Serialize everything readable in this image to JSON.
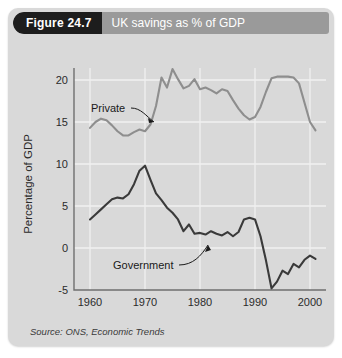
{
  "figure": {
    "tag": "Figure 24.7",
    "title": "UK savings as % of GDP",
    "source": "Source: ONS, Economic Trends"
  },
  "colors": {
    "panel_bg": "#d9d9d9",
    "band_gray": "#9a9a9a",
    "band_black": "#1d1d1d",
    "private_line": "#8e8e8e",
    "government_line": "#3a3a3a",
    "gridline": "#f0f0f0",
    "axis": "#6f6f6f"
  },
  "annotations": {
    "private_label": "Private",
    "government_label": "Government"
  },
  "chart_data": {
    "type": "line",
    "title": "UK savings as % of GDP",
    "subtitle": "",
    "xlabel": "",
    "ylabel": "Percentage of GDP",
    "xlim": [
      1959,
      2002
    ],
    "ylim": [
      -5,
      22
    ],
    "xticks": [
      1960,
      1970,
      1980,
      1990,
      2000
    ],
    "yticks": [
      -5,
      0,
      5,
      10,
      15,
      20
    ],
    "grid": "both-light-white",
    "legend": "inline-annotations",
    "x": [
      1960,
      1961,
      1962,
      1963,
      1964,
      1965,
      1966,
      1967,
      1968,
      1969,
      1970,
      1971,
      1972,
      1973,
      1974,
      1975,
      1976,
      1977,
      1978,
      1979,
      1980,
      1981,
      1982,
      1983,
      1984,
      1985,
      1986,
      1987,
      1988,
      1989,
      1990,
      1991,
      1992,
      1993,
      1994,
      1995,
      1996,
      1997,
      1998,
      1999,
      2000,
      2001
    ],
    "series": [
      {
        "name": "Private",
        "color": "#8e8e8e",
        "values": [
          14.3,
          15.0,
          15.4,
          15.2,
          14.6,
          13.9,
          13.4,
          13.4,
          13.8,
          14.1,
          13.9,
          14.7,
          16.9,
          20.3,
          19.1,
          21.3,
          20.1,
          19.0,
          19.3,
          20.1,
          18.9,
          19.1,
          18.8,
          18.4,
          18.9,
          18.7,
          17.6,
          16.6,
          15.8,
          15.3,
          15.6,
          16.8,
          18.6,
          20.2,
          20.4,
          20.4,
          20.4,
          20.3,
          19.6,
          17.3,
          15.0,
          14.0
        ]
      },
      {
        "name": "Government",
        "color": "#3a3a3a",
        "values": [
          3.4,
          4.0,
          4.6,
          5.2,
          5.8,
          6.0,
          5.9,
          6.4,
          7.6,
          9.2,
          9.8,
          8.1,
          6.5,
          5.7,
          4.8,
          4.2,
          3.4,
          2.0,
          2.8,
          1.7,
          1.8,
          1.6,
          2.0,
          1.7,
          1.5,
          1.9,
          1.4,
          1.9,
          3.4,
          3.6,
          3.4,
          1.4,
          -1.5,
          -4.8,
          -4.0,
          -2.7,
          -3.1,
          -1.9,
          -2.3,
          -1.4,
          -0.9,
          -1.3
        ]
      }
    ]
  }
}
